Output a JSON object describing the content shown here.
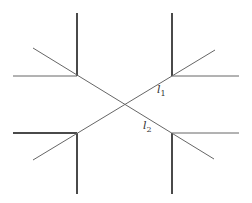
{
  "diagram": {
    "type": "line-crossing-diagram",
    "colors": {
      "line": "#4a4a4a",
      "diagonal": "#666666",
      "background": "#ffffff"
    },
    "labels": {
      "l1": {
        "base": "l",
        "sub": "1"
      },
      "l2": {
        "base": "l",
        "sub": "2"
      }
    },
    "vertices": [
      {
        "id": "top-left",
        "x": 77,
        "y": 76
      },
      {
        "id": "top-right",
        "x": 172,
        "y": 76
      },
      {
        "id": "bottom-left",
        "x": 77,
        "y": 133
      },
      {
        "id": "bottom-right",
        "x": 172,
        "y": 133
      },
      {
        "id": "center-crossing",
        "x": 124,
        "y": 104
      }
    ]
  }
}
